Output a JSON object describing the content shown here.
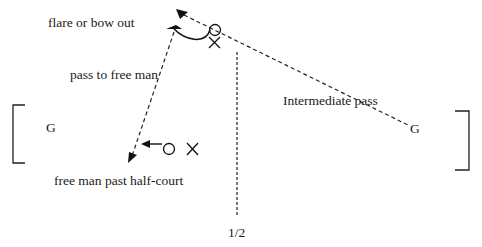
{
  "diagram": {
    "type": "basketball-play",
    "labels": {
      "flare": "flare or bow out",
      "pass_free_man": "pass to free man",
      "goal_left": "G",
      "goal_right": "G",
      "intermediate_pass": "Intermediate pass",
      "free_man": "free man past half-court",
      "half_court": "1/2"
    },
    "symbols": {
      "offense": "circle",
      "defense": "x"
    },
    "colors": {
      "line": "#111111",
      "background": "#ffffff"
    }
  }
}
